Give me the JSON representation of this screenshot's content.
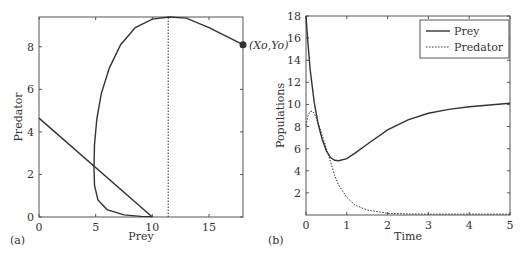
{
  "chart_data": [
    {
      "panel_label": "(a)",
      "type": "line",
      "title": "",
      "xlabel": "Prey",
      "ylabel": "Predator",
      "xlim": [
        0,
        18
      ],
      "ylim": [
        0,
        9.4
      ],
      "xticks": [
        "0",
        "5",
        "10",
        "15"
      ],
      "yticks": [
        "0",
        "2",
        "4",
        "6",
        "8"
      ],
      "grid": false,
      "annotations": [
        {
          "text": "(Xo,Yo)",
          "x": 18,
          "y": 8.1
        }
      ],
      "series": [
        {
          "name": "trajectory",
          "style": "solid",
          "x": [
            18,
            15,
            13,
            11.5,
            10,
            8.5,
            7.2,
            6.2,
            5.5,
            5.1,
            4.9,
            4.85,
            4.9,
            5.2,
            6,
            7.5,
            9,
            10
          ],
          "y": [
            8.1,
            8.9,
            9.35,
            9.4,
            9.3,
            8.9,
            8.1,
            7,
            5.8,
            4.6,
            3.4,
            2.3,
            1.5,
            0.8,
            0.35,
            0.1,
            0.03,
            0.02
          ]
        },
        {
          "name": "prey nullcline",
          "style": "solid",
          "x": [
            0,
            10
          ],
          "y": [
            4.65,
            0
          ]
        },
        {
          "name": "predator nullcline",
          "style": "dotted",
          "x": [
            11.4,
            11.4
          ],
          "y": [
            0,
            9.4
          ]
        }
      ],
      "points": [
        {
          "x": 18,
          "y": 8.1,
          "label": "(Xo,Yo)"
        }
      ]
    },
    {
      "panel_label": "(b)",
      "type": "line",
      "title": "",
      "xlabel": "Time",
      "ylabel": "Populations",
      "xlim": [
        0,
        5
      ],
      "ylim": [
        0,
        18
      ],
      "xticks": [
        "0",
        "1",
        "2",
        "3",
        "4",
        "5"
      ],
      "yticks": [
        "2",
        "4",
        "6",
        "8",
        "10",
        "12",
        "14",
        "16",
        "18"
      ],
      "grid": false,
      "legend": {
        "position": "upper right",
        "entries": [
          "Prey",
          "Predator"
        ]
      },
      "series": [
        {
          "name": "Prey",
          "style": "solid",
          "x": [
            0,
            0.05,
            0.1,
            0.2,
            0.3,
            0.4,
            0.5,
            0.6,
            0.7,
            0.8,
            1.0,
            1.2,
            1.5,
            2.0,
            2.5,
            3.0,
            3.5,
            4.0,
            4.5,
            5.0
          ],
          "y": [
            18,
            15.5,
            13.2,
            10.2,
            8.2,
            6.8,
            5.8,
            5.2,
            4.95,
            4.9,
            5.1,
            5.6,
            6.4,
            7.7,
            8.6,
            9.2,
            9.55,
            9.8,
            9.95,
            10.1
          ]
        },
        {
          "name": "Predator",
          "style": "dotted",
          "x": [
            0,
            0.05,
            0.1,
            0.15,
            0.2,
            0.3,
            0.4,
            0.5,
            0.6,
            0.7,
            0.8,
            1.0,
            1.2,
            1.5,
            2.0,
            2.5,
            3.0,
            4.0,
            5.0
          ],
          "y": [
            8.1,
            9.0,
            9.35,
            9.4,
            9.2,
            8.3,
            7.2,
            6.0,
            4.8,
            3.6,
            2.7,
            1.6,
            0.9,
            0.45,
            0.15,
            0.1,
            0.08,
            0.08,
            0.08
          ]
        }
      ]
    }
  ]
}
